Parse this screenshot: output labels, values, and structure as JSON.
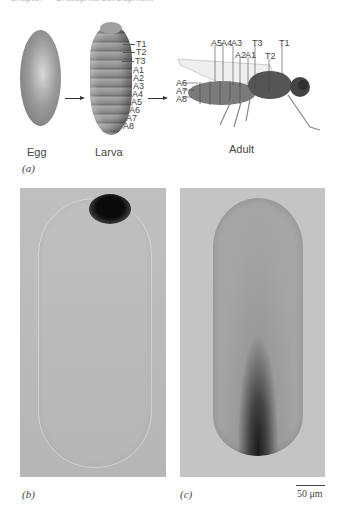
{
  "header": {
    "cropped_text": "Chapter — Drosophila development"
  },
  "panel_a": {
    "label": "(a)",
    "stages": [
      {
        "name": "Egg"
      },
      {
        "name": "Larva"
      },
      {
        "name": "Adult"
      }
    ],
    "larva_segments": [
      "T1",
      "T2",
      "T3",
      "A1",
      "A2",
      "A3",
      "A4",
      "A5",
      "A6",
      "A7",
      "A8"
    ],
    "adult_segments_top": [
      "A5",
      "A4",
      "A3",
      "A2",
      "A1",
      "T3",
      "T2",
      "T1"
    ],
    "adult_segments_left": [
      "A6",
      "A7",
      "A8"
    ]
  },
  "panel_b": {
    "label": "(b)"
  },
  "panel_c": {
    "label": "(c)"
  },
  "scale_bar": {
    "text": "50 μm"
  },
  "colors": {
    "photo_bg": "#bdbdbd",
    "embryo_dark": "#111111",
    "text": "#444444"
  }
}
